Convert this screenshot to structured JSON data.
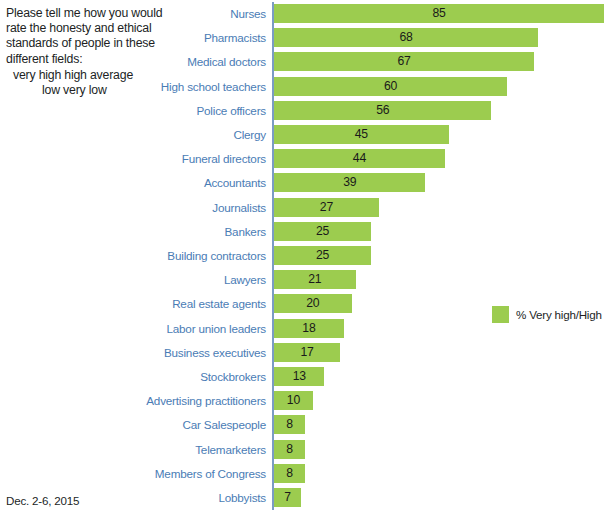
{
  "question": {
    "text": "Please tell me how you would rate the honesty and ethical standards of people in these different fields:",
    "scale_line_1": "very high     high     average",
    "scale_line_2": "low     very low"
  },
  "footnote": "Dec. 2-6, 2015",
  "legend": {
    "label": "% Very high/High",
    "swatch_color": "#9ccc4f"
  },
  "colors": {
    "bar": "#9ccc4f",
    "category_label": "#4a7cb5",
    "axis_line": "#7b9cc4",
    "value_label": "#1a1a1a",
    "question_text": "#221f1f"
  },
  "chart_data": {
    "type": "bar",
    "orientation": "horizontal",
    "title": "",
    "subtitle": "",
    "xlabel": "",
    "ylabel": "",
    "xlim": [
      0,
      85
    ],
    "grid": false,
    "legend_position": "middle-right",
    "series_name": "% Very high/High",
    "categories": [
      "Nurses",
      "Pharmacists",
      "Medical doctors",
      "High school teachers",
      "Police officers",
      "Clergy",
      "Funeral directors",
      "Accountants",
      "Journalists",
      "Bankers",
      "Building contractors",
      "Lawyers",
      "Real estate agents",
      "Labor union leaders",
      "Business executives",
      "Stockbrokers",
      "Advertising practitioners",
      "Car Salespeople",
      "Telemarketers",
      "Members of Congress",
      "Lobbyists"
    ],
    "values": [
      85,
      68,
      67,
      60,
      56,
      45,
      44,
      39,
      27,
      25,
      25,
      21,
      20,
      18,
      17,
      13,
      10,
      8,
      8,
      8,
      7
    ]
  }
}
